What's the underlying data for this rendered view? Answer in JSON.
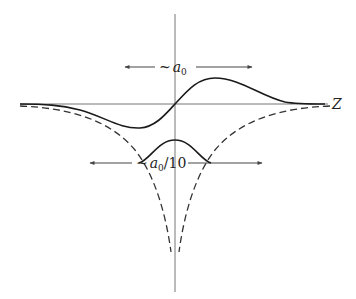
{
  "diagram": {
    "axis_label_z": "Z",
    "top_scale": {
      "tilde": "~",
      "symbol": "a",
      "subscript": "0",
      "suffix": ""
    },
    "bottom_scale": {
      "tilde": "~",
      "symbol": "a",
      "subscript": "0",
      "suffix": "/10"
    },
    "colors": {
      "axis": "#777777",
      "curve": "#1a1a1a",
      "dashed": "#333333",
      "arrow": "#444444"
    }
  }
}
